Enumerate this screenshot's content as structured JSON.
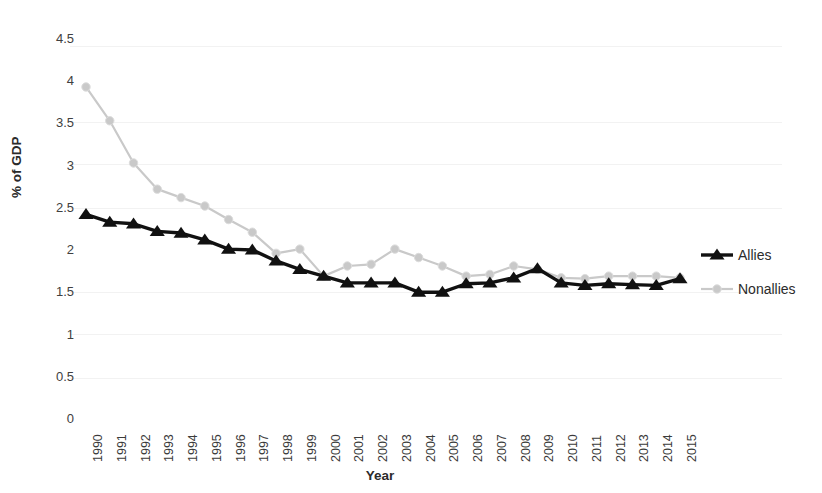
{
  "chart_data": {
    "type": "line",
    "title": "",
    "xlabel": "Year",
    "ylabel": "% of GDP",
    "categories": [
      "1990",
      "1991",
      "1992",
      "1993",
      "1994",
      "1995",
      "1996",
      "1997",
      "1998",
      "1999",
      "2000",
      "2001",
      "2002",
      "2003",
      "2004",
      "2005",
      "2006",
      "2007",
      "2008",
      "2009",
      "2010",
      "2011",
      "2012",
      "2013",
      "2014",
      "2015"
    ],
    "series": [
      {
        "name": "Allies",
        "color": "#111111",
        "marker": "triangle",
        "values": [
          2.41,
          2.32,
          2.3,
          2.21,
          2.19,
          2.11,
          2.0,
          1.99,
          1.86,
          1.76,
          1.68,
          1.6,
          1.6,
          1.6,
          1.49,
          1.49,
          1.59,
          1.6,
          1.66,
          1.77,
          1.6,
          1.57,
          1.59,
          1.58,
          1.57,
          1.65
        ]
      },
      {
        "name": "Nonallies",
        "color": "#c9c9c9",
        "marker": "circle",
        "values": [
          3.92,
          3.52,
          3.02,
          2.71,
          2.61,
          2.51,
          2.35,
          2.2,
          1.95,
          2.0,
          1.68,
          1.8,
          1.82,
          2.0,
          1.9,
          1.8,
          1.68,
          1.7,
          1.8,
          1.76,
          1.66,
          1.65,
          1.68,
          1.68,
          1.68,
          1.66
        ]
      }
    ],
    "ylim": [
      0,
      4.5
    ],
    "yticks": [
      "4.5",
      "4",
      "3.5",
      "3",
      "2.5",
      "2",
      "1.5",
      "1",
      "0.5",
      "0"
    ],
    "ytick_values": [
      4.5,
      4,
      3.5,
      3,
      2.5,
      2,
      1.5,
      1,
      0.5,
      0
    ],
    "grid": false,
    "legend_position": "right"
  },
  "legend": {
    "entries": [
      {
        "label": "Allies"
      },
      {
        "label": "Nonallies"
      }
    ]
  }
}
